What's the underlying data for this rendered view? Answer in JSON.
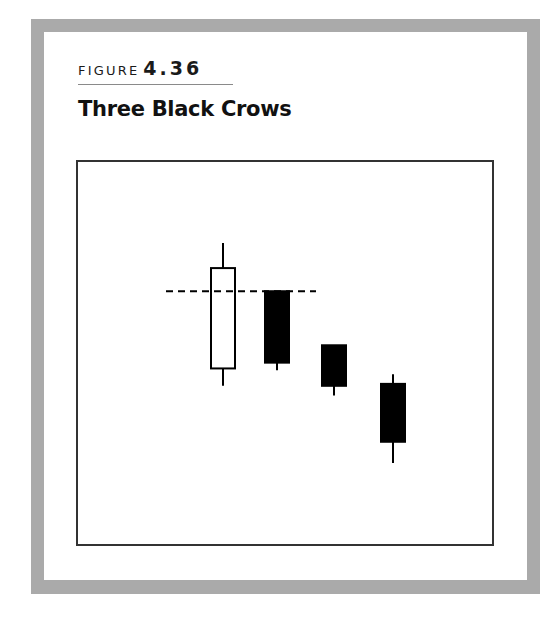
{
  "figure": {
    "label_word": "FIGURE",
    "label_number": "4.36",
    "title": "Three Black Crows"
  },
  "colors": {
    "frame": "#aaaaaa",
    "bullish_body": "#ffffff",
    "bearish_body": "#000000",
    "outline": "#000000"
  },
  "chart_data": {
    "type": "candlestick",
    "title": "Three Black Crows",
    "xlabel": "",
    "ylabel": "",
    "axes_visible": false,
    "grid": false,
    "note": "Illustrative pattern; no axis scale shown. Values are relative price units (higher = higher price), estimated from pixel positions.",
    "candles": [
      {
        "index": 1,
        "type": "bullish",
        "color": "white",
        "open": 47.5,
        "close": 73.5,
        "high": 80.0,
        "low": 43.0
      },
      {
        "index": 2,
        "type": "bearish",
        "color": "black",
        "open": 67.5,
        "close": 49.0,
        "high": 67.5,
        "low": 47.0
      },
      {
        "index": 3,
        "type": "bearish",
        "color": "black",
        "open": 53.5,
        "close": 43.0,
        "high": 53.5,
        "low": 40.5
      },
      {
        "index": 4,
        "type": "bearish",
        "color": "black",
        "open": 43.5,
        "close": 28.5,
        "high": 46.0,
        "low": 23.0
      }
    ],
    "annotations": [
      {
        "type": "dashed-horizontal-line",
        "y": 67.5,
        "from_candle": 1,
        "to_candle": 2,
        "description": "Second candle opens within the body of the first (white) candle"
      }
    ]
  }
}
